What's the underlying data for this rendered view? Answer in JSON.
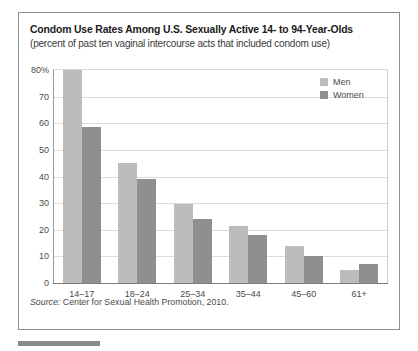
{
  "figure": {
    "title": "Condom Use Rates Among U.S. Sexually Active 14- to 94-Year-Olds",
    "subtitle": "(percent of past ten vaginal intercourse acts that included condom use)",
    "source_label": "Source:",
    "source_text": " Center for Sexual Health Promotion, 2010."
  },
  "legend": {
    "position": "top-right-inside",
    "entries": [
      {
        "label": "Men",
        "color": "#bcbcbc",
        "swatch": "legend-swatch-men"
      },
      {
        "label": "Women",
        "color": "#8f8f8f",
        "swatch": "legend-swatch-women"
      }
    ]
  },
  "yaxis": {
    "ticks": [
      {
        "label": "80%",
        "value": 80
      },
      {
        "label": "70",
        "value": 70
      },
      {
        "label": "60",
        "value": 60
      },
      {
        "label": "50",
        "value": 50
      },
      {
        "label": "40",
        "value": 40
      },
      {
        "label": "30",
        "value": 30
      },
      {
        "label": "20",
        "value": 20
      },
      {
        "label": "10",
        "value": 10
      },
      {
        "label": "0",
        "value": 0
      }
    ]
  },
  "chart_data": {
    "type": "bar",
    "title": "Condom Use Rates Among U.S. Sexually Active 14- to 94-Year-Olds",
    "subtitle": "(percent of past ten vaginal intercourse acts that included condom use)",
    "xlabel": "",
    "ylabel": "",
    "ylim": [
      0,
      80
    ],
    "ytick_step": 10,
    "grid": true,
    "legend_position": "top-right-inside",
    "categories": [
      "14–17",
      "18–24",
      "25–34",
      "35–44",
      "45–60",
      "61+"
    ],
    "series": [
      {
        "name": "Men",
        "color": "#bcbcbc",
        "values": [
          80,
          45,
          29.5,
          21.5,
          14,
          5
        ]
      },
      {
        "name": "Women",
        "color": "#8f8f8f",
        "values": [
          58.5,
          39,
          24,
          18,
          10,
          7
        ]
      }
    ],
    "source": "Source: Center for Sexual Health Promotion, 2010."
  }
}
